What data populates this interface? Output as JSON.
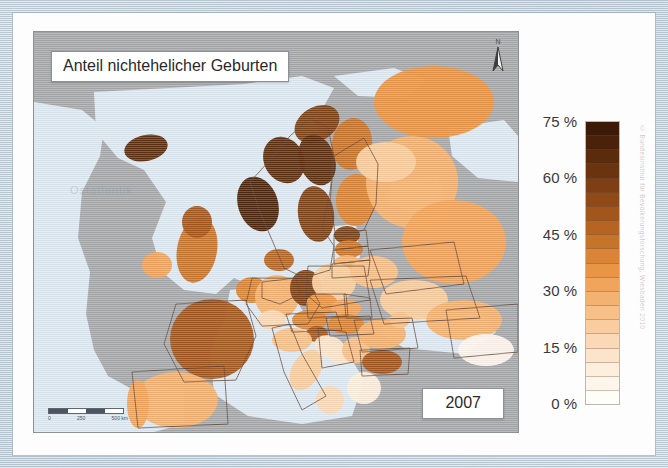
{
  "document": {
    "kind": "printed-map-figure",
    "language": "de"
  },
  "map": {
    "title": "Anteil nichtehelicher Geburten",
    "year": "2007",
    "north_arrow_label": "N",
    "ocean_watermark": "Ostatlantik",
    "scale": {
      "min_label": "0",
      "mid_label": "250",
      "max_label": "500 km"
    },
    "colors": {
      "sea": "#dfe9f2",
      "no_data_land": "#a8a9ab",
      "border": "#5a4234",
      "frame": "#c9d4dd",
      "paper": "#fdfdfd"
    }
  },
  "legend": {
    "unit": "%",
    "title": "",
    "ticks": [
      {
        "value": 75,
        "label": "75 %"
      },
      {
        "value": 60,
        "label": "60 %"
      },
      {
        "value": 45,
        "label": "45 %"
      },
      {
        "value": 30,
        "label": "30 %"
      },
      {
        "value": 15,
        "label": "15 %"
      },
      {
        "value": 0,
        "label": "0 %"
      }
    ],
    "range": [
      0,
      75
    ],
    "ramp_top_to_bottom": [
      "#3b1a08",
      "#4a2209",
      "#5a2b0c",
      "#6b3410",
      "#7d3f14",
      "#8f4a18",
      "#a2561c",
      "#b56422",
      "#c7742b",
      "#d98436",
      "#e89545",
      "#f0a45c",
      "#f4b272",
      "#f7c089",
      "#f9cda0",
      "#fbd9b8",
      "#fce4cb",
      "#fdeedd",
      "#fef6ec",
      "#fffdf8"
    ]
  },
  "credit": {
    "text": "© Bundesinstitut für Bevölkerungsforschung, Wiesbaden 2010"
  },
  "chart_data": {
    "type": "heatmap",
    "title": "Anteil nichtehelicher Geburten",
    "subtitle": "2007",
    "xlabel": "",
    "ylabel": "",
    "value_unit": "%",
    "value_range": [
      0,
      75
    ],
    "legend_position": "right",
    "grid": false,
    "regions": [
      {
        "name": "Island",
        "value": 66,
        "cx": 112,
        "cy": 116,
        "rx": 22,
        "ry": 13,
        "rot": -12
      },
      {
        "name": "Norwegen (Nord)",
        "value": 60,
        "cx": 283,
        "cy": 92,
        "rx": 24,
        "ry": 17,
        "rot": -30
      },
      {
        "name": "Norwegen (Mitte)",
        "value": 68,
        "cx": 250,
        "cy": 128,
        "rx": 20,
        "ry": 24,
        "rot": -28
      },
      {
        "name": "Norwegen (Süd)",
        "value": 72,
        "cx": 224,
        "cy": 172,
        "rx": 20,
        "ry": 28,
        "rot": -18
      },
      {
        "name": "Schweden (Nord)",
        "value": 66,
        "cx": 283,
        "cy": 128,
        "rx": 18,
        "ry": 26,
        "rot": -18
      },
      {
        "name": "Schweden (Süd)",
        "value": 58,
        "cx": 282,
        "cy": 182,
        "rx": 18,
        "ry": 28,
        "rot": -8
      },
      {
        "name": "Finnland (Nord)",
        "value": 44,
        "cx": 318,
        "cy": 112,
        "rx": 20,
        "ry": 26,
        "rot": 8
      },
      {
        "name": "Finnland (Süd)",
        "value": 41,
        "cx": 322,
        "cy": 168,
        "rx": 20,
        "ry": 26,
        "rot": 4
      },
      {
        "name": "Dänemark",
        "value": 46,
        "cx": 245,
        "cy": 228,
        "rx": 15,
        "ry": 11,
        "rot": 0
      },
      {
        "name": "Estland",
        "value": 58,
        "cx": 313,
        "cy": 203,
        "rx": 13,
        "ry": 9,
        "rot": 0
      },
      {
        "name": "Lettland",
        "value": 45,
        "cx": 315,
        "cy": 217,
        "rx": 14,
        "ry": 9,
        "rot": 0
      },
      {
        "name": "Litauen",
        "value": 29,
        "cx": 313,
        "cy": 232,
        "rx": 14,
        "ry": 9,
        "rot": 0
      },
      {
        "name": "Irland",
        "value": 33,
        "cx": 123,
        "cy": 233,
        "rx": 15,
        "ry": 13,
        "rot": 0
      },
      {
        "name": "Grossbritannien",
        "value": 44,
        "cx": 163,
        "cy": 218,
        "rx": 20,
        "ry": 33,
        "rot": 10
      },
      {
        "name": "Schottland",
        "value": 50,
        "cx": 163,
        "cy": 190,
        "rx": 15,
        "ry": 16,
        "rot": 0
      },
      {
        "name": "Frankreich",
        "value": 51,
        "cx": 178,
        "cy": 307,
        "rx": 42,
        "ry": 40,
        "rot": 0
      },
      {
        "name": "Benelux",
        "value": 38,
        "cx": 218,
        "cy": 258,
        "rx": 16,
        "ry": 13,
        "rot": 0
      },
      {
        "name": "Deutschland (West)",
        "value": 26,
        "cx": 243,
        "cy": 265,
        "rx": 22,
        "ry": 22,
        "rot": 0
      },
      {
        "name": "Deutschland (Ost)",
        "value": 58,
        "cx": 272,
        "cy": 256,
        "rx": 16,
        "ry": 18,
        "rot": 0
      },
      {
        "name": "Polen",
        "value": 20,
        "cx": 300,
        "cy": 250,
        "rx": 22,
        "ry": 19,
        "rot": 0
      },
      {
        "name": "Tschechien",
        "value": 35,
        "cx": 288,
        "cy": 272,
        "rx": 16,
        "ry": 11,
        "rot": 0
      },
      {
        "name": "Slowakei",
        "value": 30,
        "cx": 312,
        "cy": 276,
        "rx": 15,
        "ry": 9,
        "rot": 0
      },
      {
        "name": "Österreich",
        "value": 38,
        "cx": 276,
        "cy": 288,
        "rx": 18,
        "ry": 10,
        "rot": 0
      },
      {
        "name": "Schweiz",
        "value": 17,
        "cx": 238,
        "cy": 288,
        "rx": 14,
        "ry": 10,
        "rot": 0
      },
      {
        "name": "Ungarn",
        "value": 38,
        "cx": 312,
        "cy": 292,
        "rx": 18,
        "ry": 10,
        "rot": 0
      },
      {
        "name": "Slowenien",
        "value": 50,
        "cx": 283,
        "cy": 302,
        "rx": 11,
        "ry": 8,
        "rot": 0
      },
      {
        "name": "Kroatien",
        "value": 11,
        "cx": 296,
        "cy": 315,
        "rx": 16,
        "ry": 11,
        "rot": 20
      },
      {
        "name": "Bosnien",
        "value": 10,
        "cx": 306,
        "cy": 322,
        "rx": 12,
        "ry": 10,
        "rot": 0
      },
      {
        "name": "Serbien",
        "value": 23,
        "cx": 322,
        "cy": 318,
        "rx": 14,
        "ry": 13,
        "rot": 0
      },
      {
        "name": "Rumänien",
        "value": 28,
        "cx": 348,
        "cy": 302,
        "rx": 24,
        "ry": 15,
        "rot": 0
      },
      {
        "name": "Bulgarien",
        "value": 51,
        "cx": 348,
        "cy": 330,
        "rx": 20,
        "ry": 12,
        "rot": 0
      },
      {
        "name": "Griechenland",
        "value": 6,
        "cx": 330,
        "cy": 356,
        "rx": 17,
        "ry": 16,
        "rot": 0
      },
      {
        "name": "Italien (Nord)",
        "value": 22,
        "cx": 258,
        "cy": 308,
        "rx": 20,
        "ry": 12,
        "rot": 0
      },
      {
        "name": "Italien (Mitte)",
        "value": 19,
        "cx": 272,
        "cy": 338,
        "rx": 14,
        "ry": 22,
        "rot": 30
      },
      {
        "name": "Italien (Süd)",
        "value": 15,
        "cx": 296,
        "cy": 368,
        "rx": 14,
        "ry": 14,
        "rot": 25
      },
      {
        "name": "Spanien",
        "value": 28,
        "cx": 142,
        "cy": 368,
        "rx": 42,
        "ry": 28,
        "rot": 0
      },
      {
        "name": "Portugal",
        "value": 31,
        "cx": 104,
        "cy": 372,
        "rx": 11,
        "ry": 24,
        "rot": 0
      },
      {
        "name": "Belarus",
        "value": 24,
        "cx": 340,
        "cy": 240,
        "rx": 24,
        "ry": 16,
        "rot": 0
      },
      {
        "name": "Ukraine",
        "value": 21,
        "cx": 380,
        "cy": 268,
        "rx": 34,
        "ry": 20,
        "rot": 0
      },
      {
        "name": "Moldau",
        "value": 22,
        "cx": 366,
        "cy": 288,
        "rx": 10,
        "ry": 8,
        "rot": 0
      },
      {
        "name": "Russland (NW)",
        "value": 28,
        "cx": 378,
        "cy": 150,
        "rx": 46,
        "ry": 46,
        "rot": 0
      },
      {
        "name": "Russland (Zentral)",
        "value": 30,
        "cx": 420,
        "cy": 210,
        "rx": 52,
        "ry": 42,
        "rot": 0
      },
      {
        "name": "Russland (Nord)",
        "value": 36,
        "cx": 400,
        "cy": 70,
        "rx": 60,
        "ry": 36,
        "rot": 0
      },
      {
        "name": "Karelien",
        "value": 18,
        "cx": 352,
        "cy": 130,
        "rx": 30,
        "ry": 20,
        "rot": 0
      },
      {
        "name": "Russland (Süd)",
        "value": 26,
        "cx": 430,
        "cy": 288,
        "rx": 38,
        "ry": 20,
        "rot": 0
      },
      {
        "name": "Türkei",
        "value": 2,
        "cx": 452,
        "cy": 318,
        "rx": 28,
        "ry": 16,
        "rot": 0
      }
    ]
  }
}
